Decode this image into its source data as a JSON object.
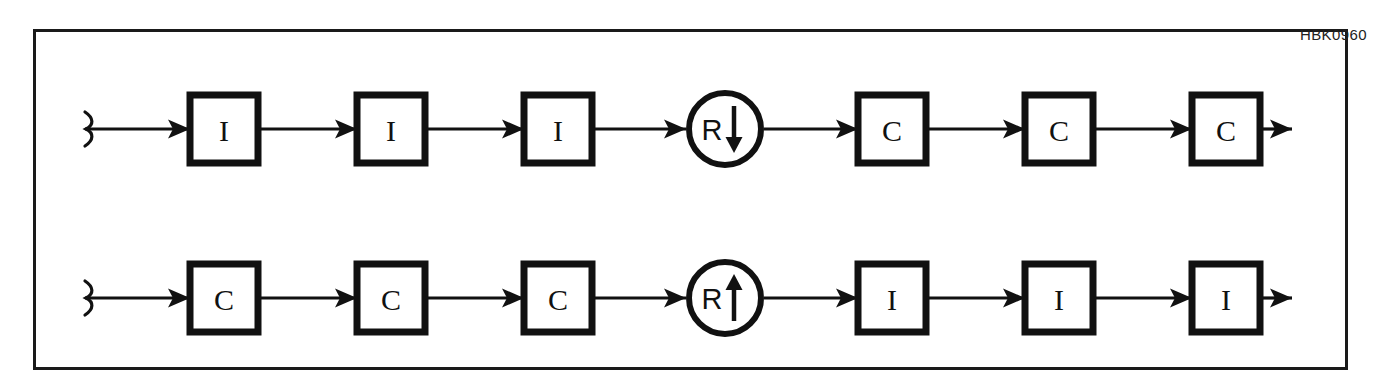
{
  "figure": {
    "id_label": "HBK0960",
    "frame": {
      "border_color": "#1a1a1a",
      "background": "#ffffff"
    },
    "ink_color": "#111111"
  },
  "rows": [
    {
      "name": "top-chain",
      "start_marker": "line-break-mark",
      "nodes": [
        {
          "shape": "square",
          "label": "I"
        },
        {
          "shape": "square",
          "label": "I"
        },
        {
          "shape": "square",
          "label": "I"
        },
        {
          "shape": "circle",
          "label": "R",
          "arrow": "down"
        },
        {
          "shape": "square",
          "label": "C"
        },
        {
          "shape": "square",
          "label": "C"
        },
        {
          "shape": "square",
          "label": "C"
        }
      ],
      "end_marker": "arrow-right"
    },
    {
      "name": "bottom-chain",
      "start_marker": "line-break-mark",
      "nodes": [
        {
          "shape": "square",
          "label": "C"
        },
        {
          "shape": "square",
          "label": "C"
        },
        {
          "shape": "square",
          "label": "C"
        },
        {
          "shape": "circle",
          "label": "R",
          "arrow": "up"
        },
        {
          "shape": "square",
          "label": "I"
        },
        {
          "shape": "square",
          "label": "I"
        },
        {
          "shape": "square",
          "label": "I"
        }
      ],
      "end_marker": "arrow-right"
    }
  ]
}
